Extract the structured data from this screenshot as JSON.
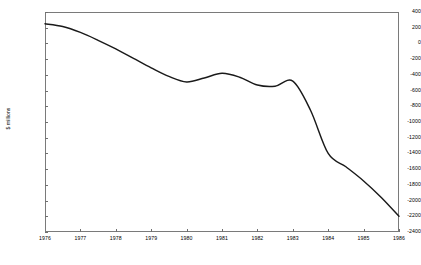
{
  "chart_data": {
    "type": "line",
    "title": "",
    "subtitle": "",
    "xlabel": "",
    "ylabel": "$ millions",
    "xlim": [
      1976,
      1986
    ],
    "ylim": [
      -2400,
      400
    ],
    "grid": false,
    "legend": false,
    "legend_position": "none",
    "x_ticks": [
      "1976",
      "1977",
      "1978",
      "1979",
      "1980",
      "1981",
      "1982",
      "1983",
      "1984",
      "1985",
      "1986"
    ],
    "y_ticks": [
      "400",
      "200",
      "0",
      "-200",
      "-400",
      "-600",
      "-800",
      "-1000",
      "-1200",
      "-1400",
      "-1600",
      "-1800",
      "-2000",
      "-2200",
      "-2400"
    ],
    "y_tick_values": [
      400,
      200,
      0,
      -200,
      -400,
      -600,
      -800,
      -1000,
      -1200,
      -1400,
      -1600,
      -1800,
      -2000,
      -2200,
      -2400
    ],
    "series": [
      {
        "name": "net balance",
        "color": "#1a1a1a",
        "x": [
          1976,
          1976.5,
          1977,
          1977.5,
          1978,
          1978.5,
          1979,
          1979.5,
          1980,
          1980.5,
          1981,
          1981.5,
          1982,
          1982.5,
          1983,
          1983.5,
          1984,
          1984.5,
          1985,
          1985.5,
          1986
        ],
        "values": [
          250,
          215,
          140,
          40,
          -70,
          -190,
          -310,
          -420,
          -490,
          -440,
          -380,
          -430,
          -530,
          -545,
          -480,
          -850,
          -1400,
          -1570,
          -1750,
          -1960,
          -2200
        ]
      }
    ],
    "annotations": []
  },
  "axis": {
    "y_axis_title": "$ millions"
  }
}
